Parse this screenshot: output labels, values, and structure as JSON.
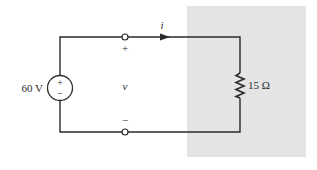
{
  "diagram": {
    "type": "circuit",
    "source": {
      "kind": "dc-voltage-source",
      "label": "60 V",
      "plus": "+",
      "minus": "−"
    },
    "terminals": {
      "top_polarity": "+",
      "bottom_polarity": "−",
      "voltage_label": "v"
    },
    "current": {
      "label": "i",
      "direction": "right"
    },
    "load": {
      "kind": "resistor",
      "label": "15 Ω"
    },
    "colors": {
      "wire": "#2a2a2a",
      "shaded_region": "#e4e4e4",
      "background": "#ffffff"
    }
  }
}
